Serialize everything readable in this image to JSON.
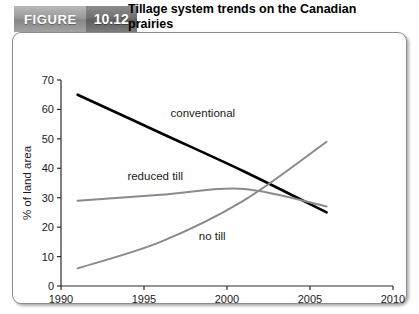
{
  "header": {
    "figure_word": "FIGURE",
    "figure_number": "10.12",
    "title_line1": "Tillage system trends on the Canadian",
    "title_line2": "prairies",
    "figure_word_bg": "#9a9a9a",
    "figure_number_bg": "#6f6f6f"
  },
  "chart_data": {
    "type": "line",
    "title": "Tillage system trends on the Canadian prairies",
    "xlabel": "",
    "ylabel": "% of land area",
    "xlim": [
      1990,
      2010
    ],
    "ylim": [
      0,
      70
    ],
    "xticks": [
      1990,
      1995,
      2000,
      2005,
      2010
    ],
    "yticks": [
      0,
      10,
      20,
      30,
      40,
      50,
      60,
      70
    ],
    "grid": false,
    "legend": "inline-labels",
    "series": [
      {
        "name": "conventional",
        "color": "#000000",
        "width": 2.6,
        "label_x": 1996.6,
        "label_y": 57.5,
        "x": [
          1991,
          1996,
          2001,
          2006
        ],
        "y": [
          65,
          52,
          39,
          25
        ]
      },
      {
        "name": "reduced till",
        "color": "#8a8a8a",
        "width": 2.0,
        "label_x": 1994.0,
        "label_y": 36.0,
        "x": [
          1991,
          1996,
          2001,
          2006
        ],
        "y": [
          29,
          31,
          33,
          27
        ]
      },
      {
        "name": "no till",
        "color": "#8a8a8a",
        "width": 2.0,
        "label_x": 1998.3,
        "label_y": 15.5,
        "x": [
          1991,
          1996,
          2001,
          2006
        ],
        "y": [
          6,
          15,
          29,
          49
        ]
      }
    ]
  }
}
